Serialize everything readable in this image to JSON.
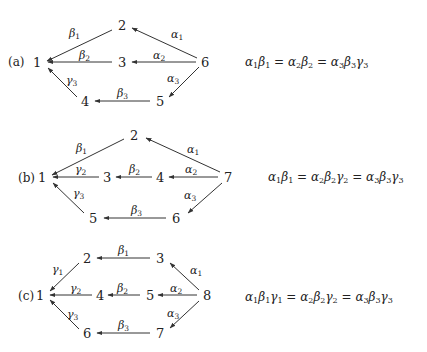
{
  "diagrams": [
    {
      "tag": "(a)",
      "nodes": {
        "1": "1",
        "2": "2",
        "3": "3",
        "4": "4",
        "5": "5",
        "6": "6"
      },
      "edges": [
        {
          "from": "6",
          "to": "2",
          "label": "α",
          "sub": "1"
        },
        {
          "from": "2",
          "to": "1",
          "label": "β",
          "sub": "1"
        },
        {
          "from": "6",
          "to": "3",
          "label": "α",
          "sub": "2"
        },
        {
          "from": "3",
          "to": "1",
          "label": "β",
          "sub": "2"
        },
        {
          "from": "6",
          "to": "5",
          "label": "α",
          "sub": "3"
        },
        {
          "from": "5",
          "to": "4",
          "label": "β",
          "sub": "3"
        },
        {
          "from": "4",
          "to": "1",
          "label": "γ",
          "sub": "3"
        }
      ],
      "equation": "α₁β₁ = α₂β₂ = α₃β₃γ₃"
    },
    {
      "tag": "(b)",
      "nodes": {
        "1": "1",
        "2": "2",
        "3": "3",
        "4": "4",
        "5": "5",
        "6": "6",
        "7": "7"
      },
      "edges": [
        {
          "from": "7",
          "to": "2",
          "label": "α",
          "sub": "1"
        },
        {
          "from": "2",
          "to": "1",
          "label": "β",
          "sub": "1"
        },
        {
          "from": "7",
          "to": "4",
          "label": "α",
          "sub": "2"
        },
        {
          "from": "4",
          "to": "3",
          "label": "β",
          "sub": "2"
        },
        {
          "from": "3",
          "to": "1",
          "label": "γ",
          "sub": "2"
        },
        {
          "from": "7",
          "to": "6",
          "label": "α",
          "sub": "3"
        },
        {
          "from": "6",
          "to": "5",
          "label": "β",
          "sub": "3"
        },
        {
          "from": "5",
          "to": "1",
          "label": "γ",
          "sub": "3"
        }
      ],
      "equation": "α₁β₁ = α₂β₂γ₂ = α₃β₃γ₃"
    },
    {
      "tag": "(c)",
      "nodes": {
        "1": "1",
        "2": "2",
        "3": "3",
        "4": "4",
        "5": "5",
        "6": "6",
        "7": "7",
        "8": "8"
      },
      "edges": [
        {
          "from": "8",
          "to": "3",
          "label": "α",
          "sub": "1"
        },
        {
          "from": "3",
          "to": "2",
          "label": "β",
          "sub": "1"
        },
        {
          "from": "2",
          "to": "1",
          "label": "γ",
          "sub": "1"
        },
        {
          "from": "8",
          "to": "5",
          "label": "α",
          "sub": "2"
        },
        {
          "from": "5",
          "to": "4",
          "label": "β",
          "sub": "2"
        },
        {
          "from": "4",
          "to": "1",
          "label": "γ",
          "sub": "2"
        },
        {
          "from": "8",
          "to": "7",
          "label": "α",
          "sub": "3"
        },
        {
          "from": "7",
          "to": "6",
          "label": "β",
          "sub": "3"
        },
        {
          "from": "6",
          "to": "1",
          "label": "γ",
          "sub": "3"
        }
      ],
      "equation": "α₁β₁γ₁ = α₂β₂γ₂ = α₃β₃γ₃"
    }
  ]
}
